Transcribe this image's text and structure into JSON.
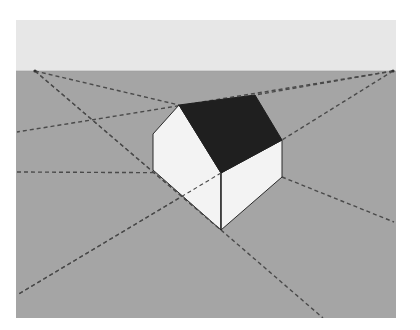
{
  "diagram": {
    "type": "two-point-perspective",
    "colors": {
      "page": "#ffffff",
      "sky": "#e7e7e7",
      "ground": "#a5a5a5",
      "roof": "#1f1f1f",
      "walls": "#f3f3f3",
      "edge": "#2a2a2a",
      "guide": "#4a4a4a"
    },
    "frame": {
      "x": 16,
      "y": 20,
      "width": 380,
      "height": 298
    },
    "horizon_y": 71,
    "vanishing_points": {
      "left": {
        "x": 35,
        "y": 71
      },
      "right": {
        "x": 393,
        "y": 71
      }
    },
    "house": {
      "roof": "179,105 255,95 282,140 221,173",
      "left_wall": "153,134 179,105 221,173 221,230 153,170",
      "right_wall": "221,173 282,140 282,177 221,230",
      "front_edge": {
        "x1": 221,
        "y1": 173,
        "x2": 221,
        "y2": 230
      }
    },
    "guide_lines": [
      {
        "id": "vpl-to-peak",
        "x1": 35,
        "y1": 71,
        "x2": 179,
        "y2": 105
      },
      {
        "id": "vpl-to-front-bottom",
        "x1": 35,
        "y1": 71,
        "x2": 221,
        "y2": 230
      },
      {
        "id": "vpr-to-roof-back",
        "x1": 393,
        "y1": 71,
        "x2": 255,
        "y2": 95
      },
      {
        "id": "vpr-through-ridge",
        "x1": 393,
        "y1": 71,
        "x2": 17,
        "y2": 132
      },
      {
        "id": "vpr-to-right-eave",
        "x1": 393,
        "y1": 71,
        "x2": 282,
        "y2": 140
      },
      {
        "id": "left-to-wall-top",
        "x1": 17,
        "y1": 172,
        "x2": 221,
        "y2": 173
      },
      {
        "id": "front-corner-down-left",
        "x1": 221,
        "y1": 173,
        "x2": 17,
        "y2": 295
      },
      {
        "id": "front-bottom-down-right",
        "x1": 221,
        "y1": 230,
        "x2": 323,
        "y2": 318
      },
      {
        "id": "right-wall-bottom-to-edge",
        "x1": 282,
        "y1": 177,
        "x2": 394,
        "y2": 222
      }
    ]
  }
}
